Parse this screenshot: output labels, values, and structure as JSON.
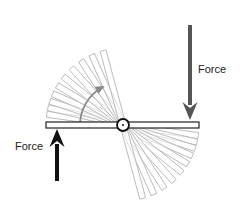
{
  "diagram": {
    "type": "lever-rotation",
    "pivot": {
      "x": 123,
      "y": 125,
      "radius": 6
    },
    "beam": {
      "left_end": 46,
      "right_end": 199,
      "thickness": 6,
      "fill": "#ffffff",
      "stroke": "#222222"
    },
    "ghost_beams": {
      "stroke": "#bbbbbb",
      "angles_deg": [
        8,
        13,
        18,
        24,
        31,
        39,
        48,
        57,
        66,
        75
      ],
      "lengths": [
        76,
        76,
        76,
        76,
        76,
        76,
        76,
        76,
        76,
        76
      ]
    },
    "rotation_arrow": {
      "color": "#888888",
      "radius": 43,
      "start_angle_deg": 180,
      "end_angle_deg": 118
    },
    "forces": [
      {
        "id": "right-force",
        "label": "Force",
        "direction": "down",
        "color": "#555555",
        "x": 190,
        "y_start": 25,
        "y_end": 120
      },
      {
        "id": "left-force",
        "label": "Force",
        "direction": "up",
        "color": "#111111",
        "x": 57,
        "y_start": 181,
        "y_end": 129
      }
    ]
  },
  "labels": {
    "right_force": "Force",
    "left_force": "Force"
  }
}
